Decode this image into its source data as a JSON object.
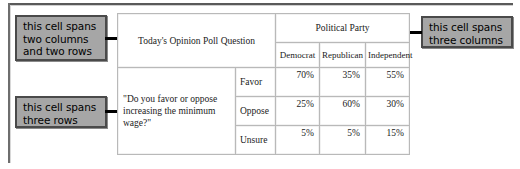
{
  "callouts": {
    "span_two": {
      "line1": "this cell spans",
      "line2": "two columns",
      "line3": "and two rows"
    },
    "span_three_rows": {
      "line1": "this cell spans",
      "line2": "three rows"
    },
    "span_three_cols": {
      "line1": "this cell spans",
      "line2": "three columns"
    }
  },
  "table": {
    "question_header": "Today's Opinion Poll Question",
    "party_header": "Political Party",
    "party_columns": [
      "Democrat",
      "Republican",
      "Independent"
    ],
    "question_text": "\"Do you favor or oppose increasing the minimum wage?\"",
    "rows": [
      {
        "stance": "Favor",
        "democrat": "70%",
        "republican": "35%",
        "independent": "55%"
      },
      {
        "stance": "Oppose",
        "democrat": "25%",
        "republican": "60%",
        "independent": "30%"
      },
      {
        "stance": "Unsure",
        "democrat": "5%",
        "republican": "5%",
        "independent": "15%"
      }
    ]
  },
  "colors": {
    "callout_fill": "#a6a6a6",
    "callout_border": "#4a4a4a",
    "table_border": "#b9b9b9",
    "arrow": "#000000",
    "page_background": "#ffffff",
    "frame_rule": "#5a5a5a"
  }
}
